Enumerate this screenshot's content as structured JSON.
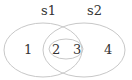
{
  "diagram": {
    "type": "venn",
    "sets": [
      {
        "label": "s1",
        "regions": [
          "1",
          "2",
          "3"
        ]
      },
      {
        "label": "s2",
        "regions": [
          "2",
          "3",
          "4"
        ]
      }
    ],
    "inner_set": {
      "regions": [
        "2",
        "3"
      ]
    },
    "labels": {
      "s1": "s1",
      "s2": "s2",
      "r1": "1",
      "r2": "2",
      "r3": "3",
      "r4": "4"
    },
    "colors": {
      "stroke": "#c8c8c8",
      "text": "#333333"
    }
  }
}
